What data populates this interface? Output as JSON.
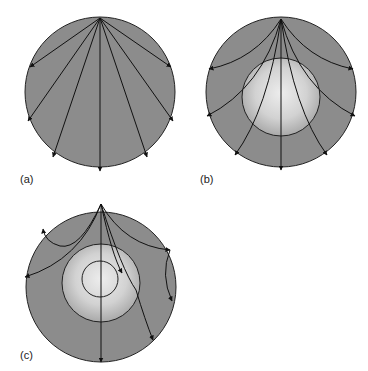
{
  "figure": {
    "panels": [
      {
        "id": "a",
        "label": "(a)",
        "description": "Uniform sphere: straight rays radiating from source at top"
      },
      {
        "id": "b",
        "label": "(b)",
        "description": "Sphere with lighter central core: rays curve around core"
      },
      {
        "id": "c",
        "label": "(c)",
        "description": "Sphere with layered core and inner core: rays refracted/reflected"
      }
    ],
    "colors": {
      "mantle": "#8c8c8c",
      "core_light": "#e6e6e6",
      "core_edge": "#a8a8a8",
      "line": "#111111"
    }
  }
}
